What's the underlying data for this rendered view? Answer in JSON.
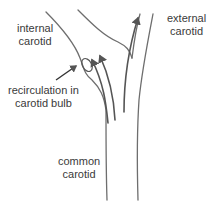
{
  "diagram": {
    "labels": {
      "internal": [
        "internal",
        "carotid"
      ],
      "external": [
        "external",
        "carotid"
      ],
      "recirculation": [
        "recirculation in",
        "carotid bulb"
      ],
      "common": [
        "common",
        "carotid"
      ]
    },
    "colors": {
      "vessel_wall": "#6e6e6e",
      "flow_arrow": "#555555",
      "text": "#3a3a3a"
    }
  }
}
